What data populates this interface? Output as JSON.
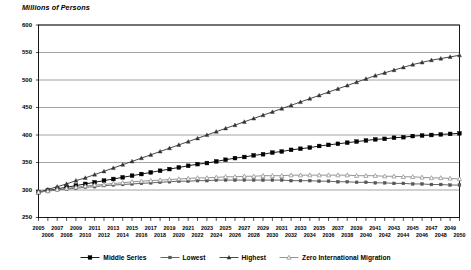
{
  "chart_data": {
    "type": "line",
    "title": "",
    "ylabel": "Millions of Persons",
    "xlabel": "",
    "ylim": [
      250,
      600
    ],
    "ytick_values": [
      250,
      300,
      350,
      400,
      450,
      500,
      550,
      600
    ],
    "ytick_labels": [
      "250",
      "300",
      "350",
      "400",
      "450",
      "500",
      "550",
      "600"
    ],
    "grid": true,
    "legend_position": "bottom",
    "x": [
      2005,
      2006,
      2007,
      2008,
      2009,
      2010,
      2011,
      2012,
      2013,
      2014,
      2015,
      2016,
      2017,
      2018,
      2019,
      2020,
      2021,
      2022,
      2023,
      2024,
      2025,
      2026,
      2027,
      2028,
      2029,
      2030,
      2031,
      2032,
      2033,
      2034,
      2035,
      2036,
      2037,
      2038,
      2039,
      2040,
      2041,
      2042,
      2043,
      2044,
      2045,
      2046,
      2047,
      2048,
      2049,
      2050
    ],
    "xtick_labels": [
      "2005",
      "2006",
      "2007",
      "2008",
      "2009",
      "2010",
      "2011",
      "2012",
      "2013",
      "2014",
      "2015",
      "2016",
      "2017",
      "2018",
      "2019",
      "2020",
      "2021",
      "2022",
      "2023",
      "2024",
      "2025",
      "2026",
      "2027",
      "2028",
      "2029",
      "2030",
      "2031",
      "2032",
      "2033",
      "2034",
      "2035",
      "2036",
      "2037",
      "2038",
      "2039",
      "2040",
      "2041",
      "2042",
      "2043",
      "2044",
      "2045",
      "2046",
      "2047",
      "2048",
      "2049",
      "2050"
    ],
    "series": [
      {
        "name": "Middle Series",
        "color": "#000000",
        "marker": "square-filled",
        "values": [
          296,
          299,
          302,
          305,
          308,
          311,
          314,
          317,
          320,
          323,
          326,
          329,
          332,
          335,
          338,
          341,
          344,
          347,
          349,
          352,
          355,
          358,
          360,
          363,
          365,
          368,
          370,
          373,
          375,
          377,
          380,
          382,
          384,
          386,
          388,
          390,
          392,
          393,
          395,
          396,
          398,
          399,
          400,
          401,
          402,
          403
        ]
      },
      {
        "name": "Lowest",
        "color": "#555555",
        "marker": "square-small",
        "values": [
          296,
          298,
          300,
          302,
          303,
          305,
          306,
          308,
          309,
          310,
          311,
          312,
          313,
          314,
          315,
          316,
          316,
          317,
          317,
          318,
          318,
          318,
          318,
          318,
          318,
          318,
          318,
          317,
          317,
          317,
          316,
          316,
          315,
          315,
          314,
          314,
          313,
          313,
          312,
          312,
          311,
          311,
          310,
          310,
          309,
          309
        ]
      },
      {
        "name": "Highest",
        "color": "#333333",
        "marker": "triangle",
        "values": [
          296,
          301,
          306,
          311,
          317,
          322,
          328,
          334,
          340,
          346,
          352,
          358,
          364,
          370,
          376,
          382,
          388,
          394,
          400,
          406,
          412,
          418,
          424,
          430,
          436,
          442,
          448,
          454,
          460,
          466,
          472,
          478,
          484,
          490,
          496,
          502,
          508,
          513,
          518,
          523,
          528,
          532,
          536,
          539,
          542,
          545
        ]
      },
      {
        "name": "Zero International Migration",
        "color": "#888888",
        "marker": "triangle-open",
        "values": [
          296,
          298,
          301,
          303,
          305,
          307,
          309,
          310,
          312,
          313,
          315,
          316,
          317,
          318,
          319,
          320,
          321,
          322,
          322,
          323,
          324,
          324,
          325,
          325,
          326,
          326,
          326,
          327,
          327,
          327,
          327,
          327,
          327,
          327,
          326,
          326,
          326,
          325,
          325,
          324,
          324,
          323,
          322,
          322,
          321,
          320
        ]
      }
    ]
  },
  "legend": {
    "items": [
      {
        "label": "Middle Series"
      },
      {
        "label": "Lowest"
      },
      {
        "label": "Highest"
      },
      {
        "label": "Zero International Migration"
      }
    ]
  }
}
